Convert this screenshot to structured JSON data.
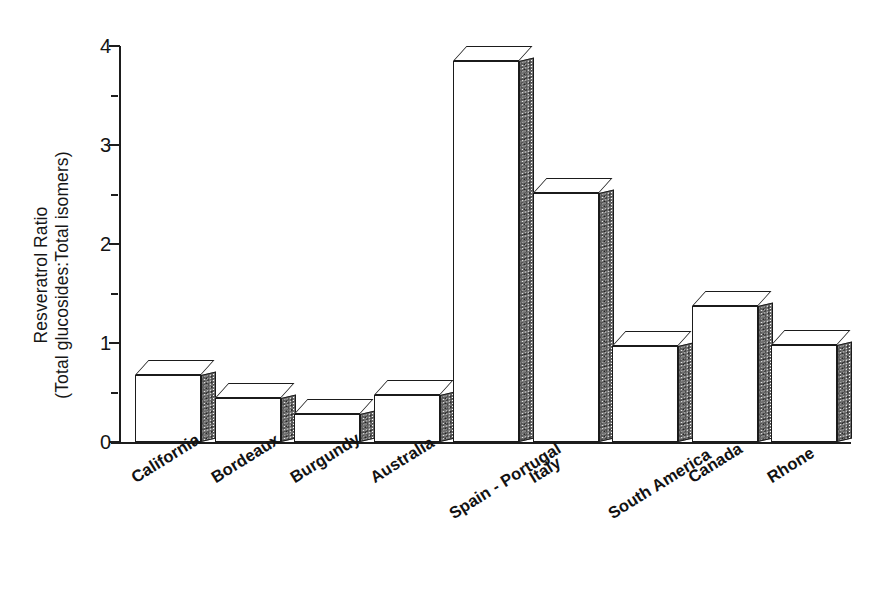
{
  "chart_data": {
    "type": "bar",
    "title": "",
    "subtitle": "",
    "xlabel": "",
    "ylabel": "Resveratrol Ratio (Total glucosides:Total isomers)",
    "ylabel_line1": "Resveratrol Ratio",
    "ylabel_line2": "(Total glucosides:Total isomers)",
    "categories": [
      "California",
      "Bordeaux",
      "Burgundy",
      "Australia",
      "Spain - Portugal",
      "Italy",
      "South America",
      "Canada",
      "Rhone"
    ],
    "values": [
      0.68,
      0.44,
      0.28,
      0.47,
      3.85,
      2.52,
      0.97,
      1.37,
      0.98
    ],
    "ylim": [
      0,
      4
    ],
    "ytick_labels": [
      "0",
      "1",
      "2",
      "3",
      "4"
    ],
    "ytick_values": [
      0,
      1,
      2,
      3,
      4
    ],
    "yminor_values": [
      0.5,
      1.5,
      2.5,
      3.5
    ],
    "grid": false,
    "legend": false,
    "legend_position": "none",
    "style": "3d-bars",
    "colors": {
      "bar_face": "#ffffff",
      "bar_outline": "#1b1b1b",
      "bar_side": "#6e6e6e",
      "axis": "#1d1d1d",
      "text": "#141414",
      "background": "#ffffff"
    }
  }
}
